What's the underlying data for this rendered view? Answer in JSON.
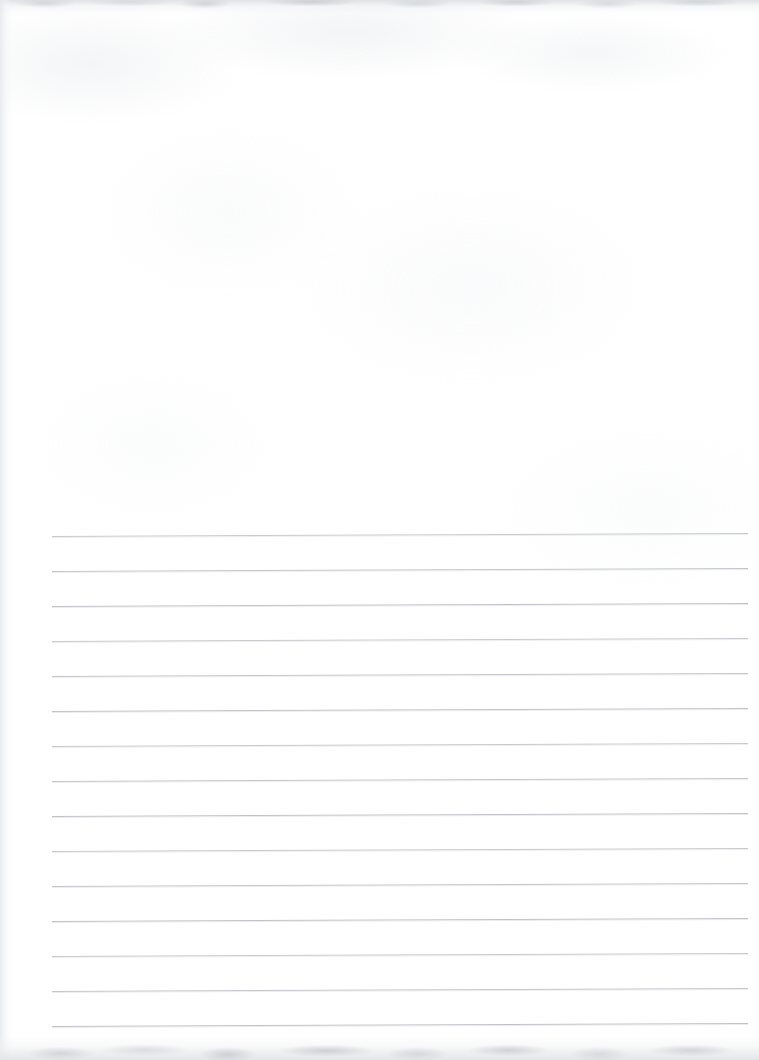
{
  "document": {
    "kind": "scanned-blank-lined-page",
    "page_width": 759,
    "page_height": 1060,
    "paper_color": "#ffffff",
    "has_text_content": false,
    "text_blocks": [],
    "headings": [],
    "page_number": "",
    "caption": ""
  },
  "ruling": {
    "line_color": "#b9bcc1",
    "line_count": 15,
    "line_spacing_px": 35,
    "first_line_y": 536,
    "left_x": 52,
    "right_x": 748,
    "line_width_px": 696,
    "tilt_degrees": -0.25,
    "lines_y": [
      536,
      571,
      606,
      641,
      676,
      711,
      746,
      781,
      816,
      851,
      886,
      921,
      956,
      991,
      1026
    ]
  },
  "scan_artifacts": {
    "top_edge_band_color": "#dee0e4",
    "left_edge_band_color": "#e6e8eb",
    "bottom_shadow_color": "#e2e4e7",
    "texture_opacity": "0.55"
  }
}
